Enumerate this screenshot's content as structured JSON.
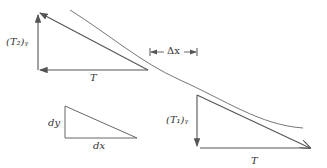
{
  "diagram": {
    "labels": {
      "t2y": "(T₂)ᵧ",
      "t1y": "(T₁)ᵧ",
      "t_top": "T",
      "t_bottom": "T",
      "delta_x": "Δx",
      "dy": "dy",
      "dx": "dx"
    },
    "colors": {
      "line": "#555555",
      "curve": "#777777"
    }
  }
}
